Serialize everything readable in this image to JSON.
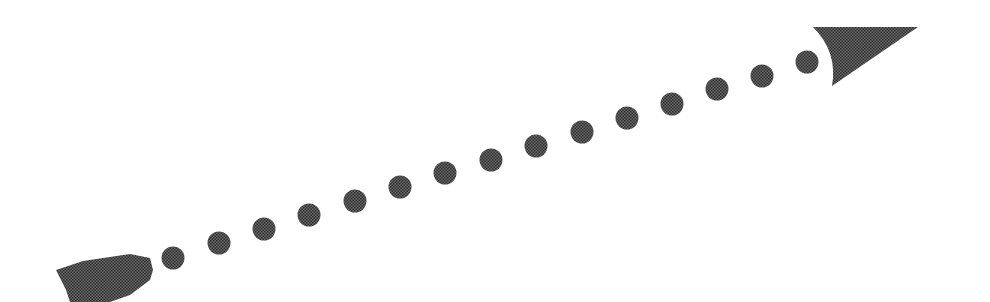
{
  "diagram": {
    "type": "dotted-arrow",
    "direction": "lower-left to upper-right",
    "fill_color": "#4a4a4a",
    "pattern": "halftone-dots",
    "background": "#ffffff",
    "tail": {
      "shape": "feathered-tail",
      "points": [
        [
          56,
          270
        ],
        [
          83,
          261
        ],
        [
          130,
          254
        ],
        [
          150,
          258
        ],
        [
          153,
          270
        ],
        [
          150,
          280
        ],
        [
          130,
          295
        ],
        [
          110,
          302
        ],
        [
          70,
          302
        ],
        [
          66,
          290
        ]
      ]
    },
    "dots": {
      "count": 15,
      "radius": 11.5,
      "centers": [
        [
          173,
          258
        ],
        [
          219,
          243
        ],
        [
          264,
          229
        ],
        [
          309,
          215
        ],
        [
          355,
          201
        ],
        [
          400,
          187
        ],
        [
          445,
          173
        ],
        [
          491,
          160
        ],
        [
          536,
          146
        ],
        [
          582,
          132
        ],
        [
          627,
          118
        ],
        [
          672,
          104
        ],
        [
          717,
          89
        ],
        [
          762,
          76
        ],
        [
          807,
          62
        ]
      ]
    },
    "head": {
      "shape": "arrowhead",
      "points": [
        [
          813,
          27
        ],
        [
          918,
          27
        ],
        [
          832,
          86
        ]
      ],
      "concave_control": [
        838,
        52
      ]
    }
  }
}
